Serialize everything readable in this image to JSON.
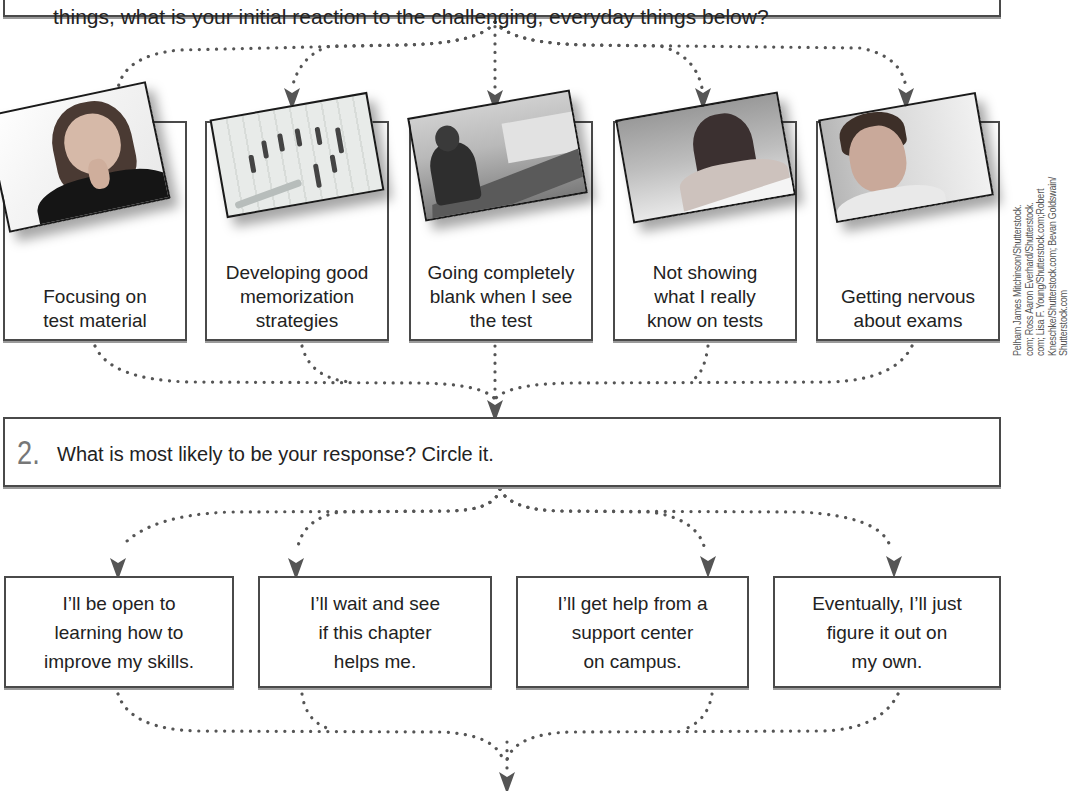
{
  "top_prompt": {
    "text": "things, what is your initial reaction to the challenging, everyday things below?"
  },
  "concerns": [
    {
      "label": "Focusing on\ntest material",
      "lines": [
        "Focusing on",
        "test material"
      ],
      "photo": "woman-thinking-photo"
    },
    {
      "label": "Developing good memorization strategies",
      "lines": [
        "Developing good",
        "memorization",
        "strategies"
      ],
      "photo": "answer-sheet-photo"
    },
    {
      "label": "Going completely blank when I see the test",
      "lines": [
        "Going completely",
        "blank when I see",
        "the test"
      ],
      "photo": "man-taking-test-photo"
    },
    {
      "label": "Not showing what I really know on tests",
      "lines": [
        "Not showing",
        "what I really",
        "know on tests"
      ],
      "photo": "woman-taking-test-photo"
    },
    {
      "label": "Getting nervous about exams",
      "lines": [
        "Getting nervous",
        "about exams"
      ],
      "photo": "nervous-student-photo"
    }
  ],
  "photo_credit": {
    "lines": [
      "Pelham James Mitchinson/Shutterstock.",
      "com; Ross Aaron Everhard/Shutterstock.",
      "com; Lisa F. Young/Shutterstock.com;Robert",
      "Kneschke/Shutterstock.com; Bevan Goldswain/",
      "Shutterstock.com"
    ]
  },
  "question2": {
    "number": "2.",
    "text": "What is most likely to be your response? Circle it."
  },
  "responses": [
    {
      "lines": [
        "I’ll be open to",
        "learning how to",
        "improve my skills."
      ]
    },
    {
      "lines": [
        "I’ll wait and see",
        "if this chapter",
        "helps me."
      ]
    },
    {
      "lines": [
        "I’ll get help from a",
        "support center",
        "on campus."
      ]
    },
    {
      "lines": [
        "Eventually, I’ll just",
        "figure it out on",
        "my own."
      ]
    }
  ],
  "colors": {
    "border": "#4a4a4a",
    "connector": "#555555",
    "number": "#777777",
    "text": "#222222"
  }
}
